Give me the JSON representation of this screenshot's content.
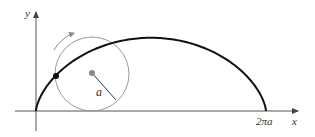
{
  "figure": {
    "axes": {
      "x_label": "x",
      "y_label": "y"
    },
    "labels": {
      "radius": "a",
      "endpoint": "2πa"
    },
    "elements": [
      "x-axis",
      "y-axis",
      "cycloid-arch",
      "rolling-circle",
      "circle-center",
      "radius-line",
      "tracing-point",
      "rotation-arrow"
    ],
    "colors": {
      "curve": "#111111",
      "circle": "#9a9a9a",
      "axes": "#444444",
      "center_dot": "#8a8a8a"
    }
  }
}
